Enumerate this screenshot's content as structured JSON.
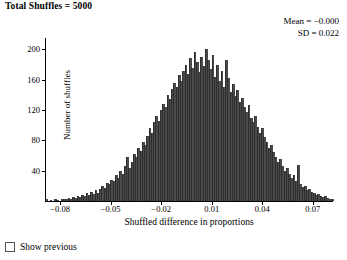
{
  "header": {
    "title": "Total Shuffles = 5000"
  },
  "stats": {
    "mean_label": "Mean = −0.000",
    "sd_label": "SD = 0.022"
  },
  "controls": {
    "show_previous_label": "Show previous",
    "show_previous_checked": false
  },
  "colors": {
    "bar_fill": "#4a4a4a",
    "axis": "#000000",
    "background": "#ffffff"
  },
  "chart_data": {
    "type": "bar",
    "title": "Total Shuffles = 5000",
    "xlabel": "Shuffled difference in proportions",
    "ylabel": "Number of shuffles",
    "xlim": [
      -0.089,
      0.082
    ],
    "ylim": [
      0,
      215
    ],
    "xticks": [
      -0.08,
      -0.05,
      -0.02,
      0.01,
      0.04,
      0.07
    ],
    "xtick_labels": [
      "−0.08",
      "−0.05",
      "−0.02",
      "0.01",
      "0.04",
      "0.07"
    ],
    "yticks": [
      40,
      80,
      120,
      160,
      200
    ],
    "ytick_labels": [
      "40",
      "80",
      "120",
      "160",
      "200"
    ],
    "grid": false,
    "legend": null,
    "annotations": [
      "Mean = −0.000",
      "SD = 0.022"
    ],
    "total_shuffles": 5000,
    "mean": -0.0005,
    "sd": 0.022,
    "bin_width": 0.0013,
    "bin_centers": [
      -0.0865,
      -0.0852,
      -0.0839,
      -0.0826,
      -0.0813,
      -0.08,
      -0.0787,
      -0.0774,
      -0.0761,
      -0.0748,
      -0.0735,
      -0.0722,
      -0.0709,
      -0.0696,
      -0.0683,
      -0.067,
      -0.0657,
      -0.0644,
      -0.0631,
      -0.0618,
      -0.0605,
      -0.0592,
      -0.0579,
      -0.0566,
      -0.0553,
      -0.054,
      -0.0527,
      -0.0514,
      -0.0501,
      -0.0488,
      -0.0475,
      -0.0462,
      -0.0449,
      -0.0436,
      -0.0423,
      -0.041,
      -0.0397,
      -0.0384,
      -0.0371,
      -0.0358,
      -0.0345,
      -0.0332,
      -0.0319,
      -0.0306,
      -0.0293,
      -0.028,
      -0.0267,
      -0.0254,
      -0.0241,
      -0.0228,
      -0.0215,
      -0.0202,
      -0.0189,
      -0.0176,
      -0.0163,
      -0.015,
      -0.0137,
      -0.0124,
      -0.0111,
      -0.0098,
      -0.0085,
      -0.0072,
      -0.0059,
      -0.0046,
      -0.0033,
      -0.002,
      -0.0007,
      0.0006,
      0.0019,
      0.0032,
      0.0045,
      0.0058,
      0.0071,
      0.0084,
      0.0097,
      0.011,
      0.0123,
      0.0136,
      0.0149,
      0.0162,
      0.0175,
      0.0188,
      0.0201,
      0.0214,
      0.0227,
      0.024,
      0.0253,
      0.0266,
      0.0279,
      0.0292,
      0.0305,
      0.0318,
      0.0331,
      0.0344,
      0.0357,
      0.037,
      0.0383,
      0.0396,
      0.0409,
      0.0422,
      0.0435,
      0.0448,
      0.0461,
      0.0474,
      0.0487,
      0.05,
      0.0513,
      0.0526,
      0.0539,
      0.0552,
      0.0565,
      0.0578,
      0.0591,
      0.0604,
      0.0617,
      0.063,
      0.0643,
      0.0656,
      0.0669,
      0.0682,
      0.0695,
      0.0708,
      0.0721,
      0.0734,
      0.0747,
      0.076,
      0.0773,
      0.0786
    ],
    "counts": [
      2,
      0,
      1,
      0,
      2,
      1,
      0,
      2,
      3,
      2,
      4,
      3,
      5,
      4,
      6,
      5,
      8,
      6,
      10,
      8,
      12,
      9,
      14,
      11,
      16,
      20,
      17,
      24,
      22,
      28,
      26,
      34,
      30,
      40,
      36,
      46,
      58,
      44,
      52,
      62,
      58,
      70,
      66,
      78,
      74,
      86,
      96,
      90,
      104,
      112,
      106,
      120,
      128,
      124,
      140,
      134,
      148,
      156,
      150,
      166,
      158,
      172,
      180,
      168,
      188,
      176,
      196,
      184,
      170,
      190,
      178,
      200,
      186,
      174,
      192,
      164,
      180,
      158,
      172,
      150,
      186,
      162,
      144,
      154,
      138,
      146,
      130,
      136,
      124,
      118,
      126,
      110,
      104,
      112,
      98,
      90,
      96,
      84,
      78,
      70,
      74,
      64,
      58,
      52,
      56,
      46,
      40,
      44,
      36,
      30,
      34,
      26,
      48,
      22,
      18,
      20,
      14,
      16,
      12,
      10,
      8,
      9,
      6,
      5,
      7,
      4,
      3,
      2
    ]
  }
}
